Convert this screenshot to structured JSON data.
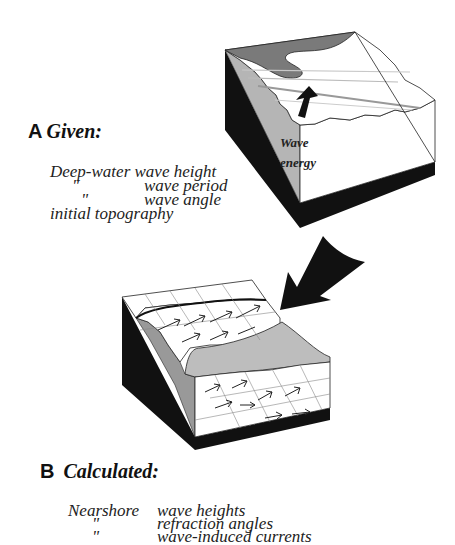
{
  "panel_a": {
    "letter": "A",
    "heading": "Given:",
    "lines": [
      {
        "col1": "Deep-water",
        "col2": "wave height"
      },
      {
        "col1": "\"",
        "col2": "wave period"
      },
      {
        "col1": "\"",
        "col2": "wave angle"
      },
      {
        "col1": "initial topography",
        "col2": ""
      }
    ],
    "block_label_1": "Wave",
    "block_label_2": "energy"
  },
  "panel_b": {
    "letter": "B",
    "heading": "Calculated:",
    "lines": [
      {
        "col1": "Nearshore",
        "col2": "wave heights"
      },
      {
        "col1": "\"",
        "col2": "refraction angles"
      },
      {
        "col1": "\"",
        "col2": "wave-induced currents"
      }
    ]
  },
  "colors": {
    "black_face": "#111111",
    "gray_slope": "#b5b5b5",
    "dark_water": "#7a7a7a",
    "white_face": "#ffffff"
  }
}
